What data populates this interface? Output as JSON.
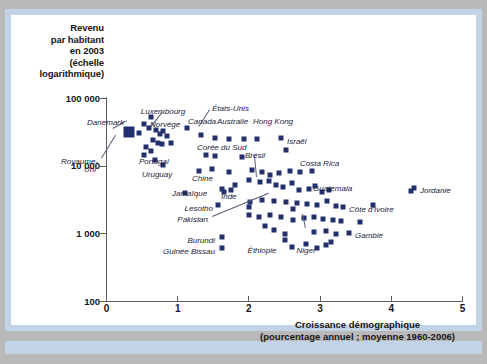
{
  "figure": {
    "background_color": "#b9b9b9",
    "frame_color": "#c3d3e6",
    "plot_background": "#ffffff",
    "marker_color": "#24306e"
  },
  "chart_data": {
    "type": "scatter",
    "title": "",
    "ylabel": "Revenu par habitant en 2003 (échelle logarithmique)",
    "xlabel": "Croissance démographique (pourcentage annuel ; moyenne 1960-2006)",
    "ylabel_lines": [
      "Revenu",
      "par habitant",
      "en 2003",
      "(échelle",
      "logarithmique)"
    ],
    "xlabel_lines": [
      "Croissance démographique",
      "(pourcentage annuel ; moyenne 1960-2006)"
    ],
    "yscale": "log",
    "ylim": [
      100,
      100000
    ],
    "ytick_labels": [
      "100 000",
      "10 000",
      "1 000",
      "100"
    ],
    "ytick_values": [
      100000,
      10000,
      1000,
      100
    ],
    "xlim": [
      0,
      5
    ],
    "xtick_labels": [
      "0",
      "1",
      "2",
      "3",
      "4",
      "5"
    ],
    "xtick_values": [
      0,
      1,
      2,
      3,
      4,
      5
    ],
    "grid": false,
    "legend": "none",
    "marker": "square",
    "annotations": [
      {
        "label": "Danemark",
        "x": 0.3,
        "y": 33000
      },
      {
        "label": "Luxembourg",
        "x": 0.62,
        "y": 55000
      },
      {
        "label": "Norvège",
        "x": 0.55,
        "y": 43000
      },
      {
        "label": "États-Unis",
        "x": 1.15,
        "y": 38000
      },
      {
        "label": "Canada",
        "x": 1.55,
        "y": 27000
      },
      {
        "label": "Australie",
        "x": 1.82,
        "y": 26000
      },
      {
        "label": "Hong Kong",
        "x": 2.2,
        "y": 26000
      },
      {
        "label": "Royaume-Uni",
        "x": 0.3,
        "y": 30000
      },
      {
        "label": "Portugal",
        "x": 0.5,
        "y": 14000
      },
      {
        "label": "Uruguay",
        "x": 0.66,
        "y": 8600
      },
      {
        "label": "Jamaïque",
        "x": 1.1,
        "y": 4000
      },
      {
        "label": "Corée du Sud",
        "x": 1.62,
        "y": 13000
      },
      {
        "label": "Israël",
        "x": 2.55,
        "y": 17500
      },
      {
        "label": "Brésil",
        "x": 2.3,
        "y": 7800
      },
      {
        "label": "Costa Rica",
        "x": 2.9,
        "y": 8400
      },
      {
        "label": "Chine",
        "x": 1.7,
        "y": 5000
      },
      {
        "label": "Inde",
        "x": 2.05,
        "y": 3000
      },
      {
        "label": "Lesotho",
        "x": 2.0,
        "y": 2500
      },
      {
        "label": "Pakistan",
        "x": 2.5,
        "y": 2300
      },
      {
        "label": "Guatemala",
        "x": 3.1,
        "y": 4300
      },
      {
        "label": "Jordanie",
        "x": 4.3,
        "y": 4300
      },
      {
        "label": "Côte d'Ivoire",
        "x": 3.75,
        "y": 2700
      },
      {
        "label": "Gambie",
        "x": 3.55,
        "y": 1500
      },
      {
        "label": "Burundi",
        "x": 2.5,
        "y": 1000
      },
      {
        "label": "Guinée Bissau",
        "x": 2.5,
        "y": 820
      },
      {
        "label": "Éthiopie",
        "x": 2.6,
        "y": 630
      },
      {
        "label": "Niger",
        "x": 3.1,
        "y": 700
      }
    ],
    "points": [
      {
        "x": 0.3,
        "y": 33000
      },
      {
        "x": 0.45,
        "y": 31000
      },
      {
        "x": 0.52,
        "y": 42000
      },
      {
        "x": 0.62,
        "y": 53000
      },
      {
        "x": 0.6,
        "y": 37000
      },
      {
        "x": 0.7,
        "y": 34000
      },
      {
        "x": 0.75,
        "y": 30000
      },
      {
        "x": 0.8,
        "y": 33000
      },
      {
        "x": 0.85,
        "y": 28000
      },
      {
        "x": 0.66,
        "y": 24000
      },
      {
        "x": 0.72,
        "y": 22000
      },
      {
        "x": 0.78,
        "y": 21000
      },
      {
        "x": 0.9,
        "y": 22000
      },
      {
        "x": 0.55,
        "y": 19000
      },
      {
        "x": 0.62,
        "y": 16500
      },
      {
        "x": 0.52,
        "y": 14500
      },
      {
        "x": 0.68,
        "y": 12500
      },
      {
        "x": 0.8,
        "y": 10500
      },
      {
        "x": 1.13,
        "y": 37000
      },
      {
        "x": 1.33,
        "y": 29000
      },
      {
        "x": 1.52,
        "y": 26500
      },
      {
        "x": 1.72,
        "y": 25000
      },
      {
        "x": 1.93,
        "y": 25500
      },
      {
        "x": 2.12,
        "y": 25500
      },
      {
        "x": 1.4,
        "y": 14500
      },
      {
        "x": 1.52,
        "y": 14000
      },
      {
        "x": 1.9,
        "y": 13500
      },
      {
        "x": 2.52,
        "y": 17500
      },
      {
        "x": 1.3,
        "y": 8400
      },
      {
        "x": 1.48,
        "y": 9200
      },
      {
        "x": 1.72,
        "y": 8200
      },
      {
        "x": 2.05,
        "y": 8800
      },
      {
        "x": 2.18,
        "y": 8200
      },
      {
        "x": 2.3,
        "y": 7500
      },
      {
        "x": 2.42,
        "y": 8000
      },
      {
        "x": 2.58,
        "y": 8400
      },
      {
        "x": 2.72,
        "y": 8200
      },
      {
        "x": 2.88,
        "y": 8400
      },
      {
        "x": 1.1,
        "y": 4000
      },
      {
        "x": 1.62,
        "y": 4600
      },
      {
        "x": 1.8,
        "y": 5300
      },
      {
        "x": 2.0,
        "y": 6200
      },
      {
        "x": 2.15,
        "y": 5800
      },
      {
        "x": 2.28,
        "y": 6000
      },
      {
        "x": 2.38,
        "y": 5300
      },
      {
        "x": 2.48,
        "y": 4900
      },
      {
        "x": 2.6,
        "y": 5600
      },
      {
        "x": 2.7,
        "y": 4400
      },
      {
        "x": 2.85,
        "y": 4600
      },
      {
        "x": 3.02,
        "y": 4200
      },
      {
        "x": 3.12,
        "y": 4400
      },
      {
        "x": 2.02,
        "y": 3000
      },
      {
        "x": 2.18,
        "y": 3200
      },
      {
        "x": 2.35,
        "y": 3100
      },
      {
        "x": 2.52,
        "y": 3000
      },
      {
        "x": 2.68,
        "y": 2900
      },
      {
        "x": 2.82,
        "y": 2800
      },
      {
        "x": 2.96,
        "y": 2700
      },
      {
        "x": 3.1,
        "y": 3100
      },
      {
        "x": 3.22,
        "y": 2600
      },
      {
        "x": 2.0,
        "y": 2500
      },
      {
        "x": 2.62,
        "y": 2300
      },
      {
        "x": 2.0,
        "y": 1900
      },
      {
        "x": 2.14,
        "y": 1800
      },
      {
        "x": 2.3,
        "y": 1900
      },
      {
        "x": 2.45,
        "y": 1750
      },
      {
        "x": 2.62,
        "y": 1600
      },
      {
        "x": 2.78,
        "y": 1700
      },
      {
        "x": 2.92,
        "y": 1800
      },
      {
        "x": 3.04,
        "y": 1650
      },
      {
        "x": 3.18,
        "y": 1600
      },
      {
        "x": 3.3,
        "y": 1550
      },
      {
        "x": 3.56,
        "y": 1500
      },
      {
        "x": 3.74,
        "y": 2700
      },
      {
        "x": 4.28,
        "y": 4300
      },
      {
        "x": 2.5,
        "y": 1000
      },
      {
        "x": 2.5,
        "y": 820
      },
      {
        "x": 2.6,
        "y": 640
      },
      {
        "x": 2.8,
        "y": 700
      },
      {
        "x": 2.95,
        "y": 620
      },
      {
        "x": 3.08,
        "y": 690
      },
      {
        "x": 3.16,
        "y": 760
      },
      {
        "x": 2.92,
        "y": 1050
      },
      {
        "x": 3.08,
        "y": 1100
      },
      {
        "x": 3.22,
        "y": 1000
      },
      {
        "x": 2.35,
        "y": 1150
      },
      {
        "x": 2.22,
        "y": 1300
      }
    ]
  }
}
